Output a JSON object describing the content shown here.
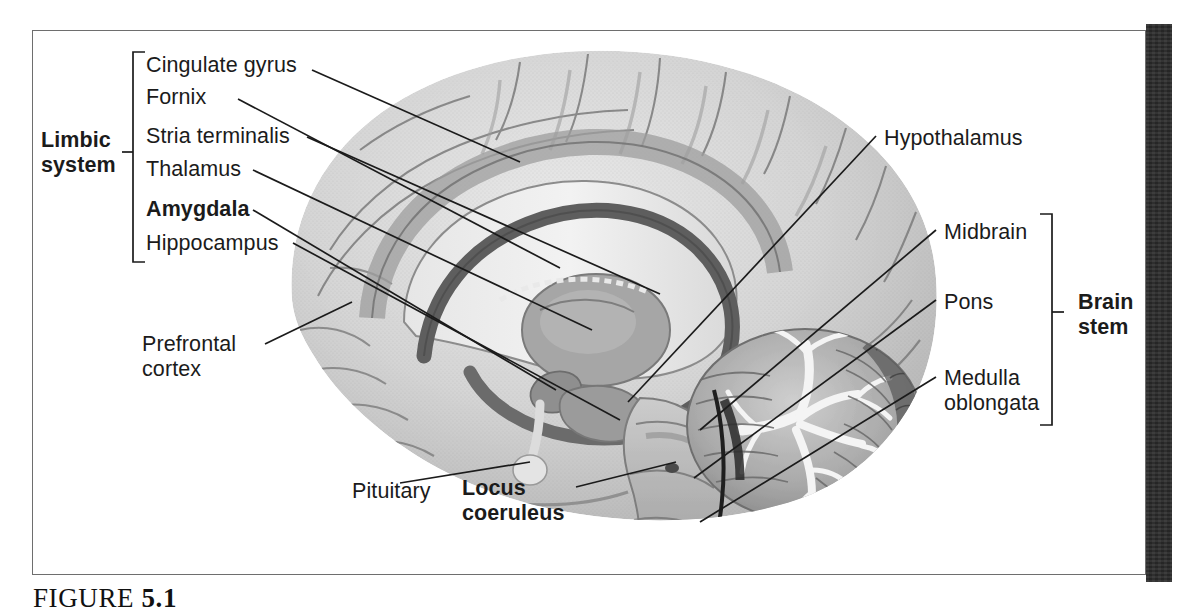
{
  "figure": {
    "caption_label": "FIGURE",
    "caption_number": "5.1"
  },
  "groups": {
    "limbic": {
      "line1": "Limbic",
      "line2": "system"
    },
    "brainstem": {
      "line1": "Brain",
      "line2": "stem"
    }
  },
  "labels": {
    "cingulate_gyrus": "Cingulate gyrus",
    "fornix": "Fornix",
    "stria_terminalis": "Stria terminalis",
    "thalamus": "Thalamus",
    "amygdala": "Amygdala",
    "hippocampus": "Hippocampus",
    "prefrontal_line1": "Prefrontal",
    "prefrontal_line2": "cortex",
    "pituitary": "Pituitary",
    "locus_line1": "Locus",
    "locus_line2": "coeruleus",
    "hypothalamus": "Hypothalamus",
    "midbrain": "Midbrain",
    "pons": "Pons",
    "medulla_line1": "Medulla",
    "medulla_line2": "oblongata"
  },
  "colors": {
    "ink": "#1b1b1b",
    "frame": "#6e6e6e",
    "dark_bar": "#2b2b2b",
    "cortex_light": "#d8d8d8",
    "cortex_mid": "#bdbdbd",
    "deep_gray": "#8a8a8a",
    "dark_structure": "#6a6a6a",
    "cerebellum": "#a8a8a8",
    "white_matter": "#efefef"
  }
}
